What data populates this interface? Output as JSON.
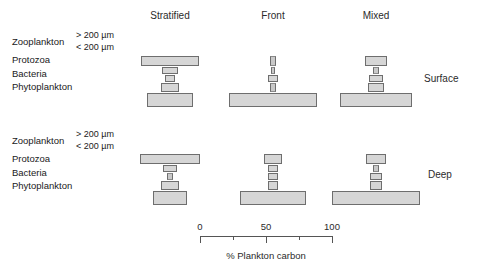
{
  "figure": {
    "columns": [
      {
        "key": "stratified",
        "label": "Stratified",
        "center_x": 170
      },
      {
        "key": "front",
        "label": "Front",
        "center_x": 273
      },
      {
        "key": "mixed",
        "label": "Mixed",
        "center_x": 376
      }
    ],
    "rows": [
      {
        "key": "surface",
        "label": "Surface",
        "baseline_y": 107
      },
      {
        "key": "deep",
        "label": "Deep",
        "baseline_y": 205
      }
    ],
    "tier_labels": {
      "zooplankton": "Zooplankton",
      "size_large": "> 200 µm",
      "size_small": "< 200 µm",
      "protozoa": "Protozoa",
      "bacteria": "Bacteria",
      "phytoplankton": "Phytoplankton"
    },
    "side_labels": {
      "surface": "Surface",
      "deep": "Deep"
    }
  },
  "chart_data": {
    "type": "bar",
    "title": "",
    "xlabel": "% Plankton carbon",
    "ylabel": "",
    "xlim": [
      0,
      100
    ],
    "grid": false,
    "legend": "none",
    "orientation": "horizontal-centered-stack",
    "tiers_top_to_bottom": [
      "Zooplankton > 200 µm",
      "Zooplankton < 200 µm",
      "Protozoa",
      "Bacteria",
      "Phytoplankton"
    ],
    "axis": {
      "major_ticks": [
        0,
        50,
        100
      ],
      "major_tick_labels": [
        "0",
        "50",
        "100"
      ],
      "minor_ticks": [
        25,
        75
      ],
      "caption": "% Plankton carbon"
    },
    "panels": [
      {
        "row": "Surface",
        "column": "Stratified",
        "values": [
          44,
          12,
          8,
          13,
          35
        ]
      },
      {
        "row": "Surface",
        "column": "Front",
        "values": [
          4,
          3,
          8,
          4,
          66
        ]
      },
      {
        "row": "Surface",
        "column": "Mixed",
        "values": [
          17,
          5,
          10,
          12,
          55
        ]
      },
      {
        "row": "Deep",
        "column": "Stratified",
        "values": [
          46,
          11,
          4,
          14,
          26
        ]
      },
      {
        "row": "Deep",
        "column": "Front",
        "values": [
          14,
          7,
          7,
          7,
          50
        ]
      },
      {
        "row": "Deep",
        "column": "Mixed",
        "values": [
          15,
          4,
          9,
          9,
          66
        ]
      }
    ]
  },
  "style": {
    "bar_fill": "#d6d6d6",
    "bar_stroke": "#6e6e6e",
    "axis_color": "#555555",
    "text_color": "#2b2b2b",
    "background": "#ffffff"
  }
}
